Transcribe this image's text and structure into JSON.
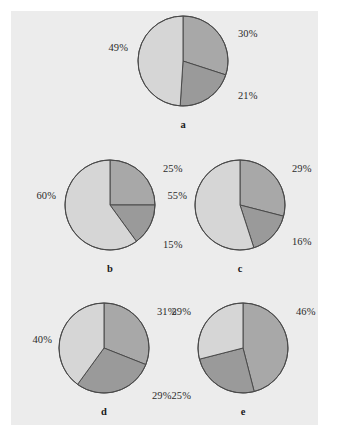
{
  "figure": {
    "background_color": "#ececec",
    "page_color": "#ffffff",
    "outline_color": "#4a4a4a"
  },
  "chart_data": [
    {
      "type": "pie",
      "title": "a",
      "caption": "a",
      "categories": [
        "segment-1",
        "segment-2",
        "segment-3"
      ],
      "values": [
        30,
        21,
        49
      ],
      "labels": [
        "30%",
        "21%",
        "49%"
      ],
      "colors": [
        "#a8a8a8",
        "#9a9a9a",
        "#d6d6d6"
      ],
      "start_angle_deg": 0,
      "direction": "clockwise",
      "units": "percent"
    },
    {
      "type": "pie",
      "title": "b",
      "caption": "b",
      "categories": [
        "segment-1",
        "segment-2",
        "segment-3"
      ],
      "values": [
        25,
        15,
        60
      ],
      "labels": [
        "25%",
        "15%",
        "60%"
      ],
      "colors": [
        "#a8a8a8",
        "#9a9a9a",
        "#d6d6d6"
      ],
      "start_angle_deg": 0,
      "direction": "clockwise",
      "units": "percent"
    },
    {
      "type": "pie",
      "title": "c",
      "caption": "c",
      "categories": [
        "segment-1",
        "segment-2",
        "segment-3"
      ],
      "values": [
        29,
        16,
        55
      ],
      "labels": [
        "29%",
        "16%",
        "55%"
      ],
      "colors": [
        "#a8a8a8",
        "#9a9a9a",
        "#d6d6d6"
      ],
      "start_angle_deg": 0,
      "direction": "clockwise",
      "units": "percent"
    },
    {
      "type": "pie",
      "title": "d",
      "caption": "d",
      "categories": [
        "segment-1",
        "segment-2",
        "segment-3"
      ],
      "values": [
        31,
        29,
        40
      ],
      "labels": [
        "31%",
        "29%",
        "40%"
      ],
      "colors": [
        "#a8a8a8",
        "#9a9a9a",
        "#d6d6d6"
      ],
      "start_angle_deg": 0,
      "direction": "clockwise",
      "units": "percent"
    },
    {
      "type": "pie",
      "title": "e",
      "caption": "e",
      "categories": [
        "segment-1",
        "segment-2",
        "segment-3"
      ],
      "values": [
        46,
        25,
        29
      ],
      "labels": [
        "46%",
        "25%",
        "29%"
      ],
      "colors": [
        "#a8a8a8",
        "#9a9a9a",
        "#d6d6d6"
      ],
      "start_angle_deg": 0,
      "direction": "clockwise",
      "units": "percent"
    }
  ],
  "charts": [
    {
      "caption": "a",
      "center_x": 183,
      "center_y": 61,
      "radius": 45,
      "caption_x": 183,
      "caption_y": 119,
      "label_positions": [
        {
          "text": "30%",
          "x": 238,
          "y": 28,
          "anchor": "start"
        },
        {
          "text": "21%",
          "x": 238,
          "y": 90,
          "anchor": "start"
        },
        {
          "text": "49%",
          "x": 128,
          "y": 42,
          "anchor": "end"
        }
      ]
    },
    {
      "caption": "b",
      "center_x": 110,
      "center_y": 205,
      "radius": 45,
      "caption_x": 110,
      "caption_y": 263,
      "label_positions": [
        {
          "text": "25%",
          "x": 163,
          "y": 163,
          "anchor": "start"
        },
        {
          "text": "15%",
          "x": 163,
          "y": 239,
          "anchor": "start"
        },
        {
          "text": "60%",
          "x": 56,
          "y": 190,
          "anchor": "end"
        }
      ]
    },
    {
      "caption": "c",
      "center_x": 240,
      "center_y": 205,
      "radius": 45,
      "caption_x": 240,
      "caption_y": 263,
      "label_positions": [
        {
          "text": "29%",
          "x": 292,
          "y": 163,
          "anchor": "start"
        },
        {
          "text": "16%",
          "x": 292,
          "y": 236,
          "anchor": "start"
        },
        {
          "text": "55%",
          "x": 187,
          "y": 190,
          "anchor": "end"
        }
      ]
    },
    {
      "caption": "d",
      "center_x": 104,
      "center_y": 348,
      "radius": 45,
      "caption_x": 104,
      "caption_y": 406,
      "label_positions": [
        {
          "text": "31%",
          "x": 157,
          "y": 306,
          "anchor": "start"
        },
        {
          "text": "29%",
          "x": 152,
          "y": 390,
          "anchor": "start"
        },
        {
          "text": "40%",
          "x": 52,
          "y": 334,
          "anchor": "end"
        }
      ]
    },
    {
      "caption": "e",
      "center_x": 243,
      "center_y": 348,
      "radius": 45,
      "caption_x": 243,
      "caption_y": 406,
      "label_positions": [
        {
          "text": "46%",
          "x": 296,
          "y": 306,
          "anchor": "start"
        },
        {
          "text": "25%",
          "x": 191,
          "y": 390,
          "anchor": "end"
        },
        {
          "text": "29%",
          "x": 191,
          "y": 306,
          "anchor": "end"
        }
      ]
    }
  ]
}
